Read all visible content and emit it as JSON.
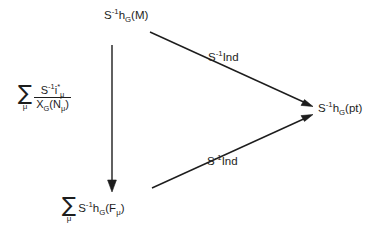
{
  "diagram": {
    "type": "commutative-triangle",
    "nodes": [
      {
        "id": "top",
        "name": "node-top",
        "tex": "S^{-1} h_G(M)",
        "base": "S",
        "exponent": "-1",
        "functor": "h",
        "functor_sub": "G",
        "argument": "(M)",
        "has_sum": false
      },
      {
        "id": "right",
        "name": "node-right",
        "tex": "S^{-1} h_G(pt)",
        "base": "S",
        "exponent": "-1",
        "functor": "h",
        "functor_sub": "G",
        "argument": "(pt)",
        "has_sum": false
      },
      {
        "id": "bottom",
        "name": "node-bottom",
        "tex": "\\sum_\\mu S^{-1} h_G(F_\\mu)",
        "sum_symbol": "∑",
        "sum_index": "μ",
        "base": "S",
        "exponent": "-1",
        "functor": "h",
        "functor_sub": "G",
        "argument_open": "(",
        "argument_sym": "F",
        "argument_sub": "μ",
        "argument_close": ")",
        "has_sum": true
      }
    ],
    "edges": [
      {
        "id": "top-to-right",
        "name": "arrow-top-to-right",
        "from": "top",
        "to": "right",
        "label": {
          "base": "S",
          "exponent": "-1",
          "operator": "Ind"
        }
      },
      {
        "id": "bottom-to-right",
        "name": "arrow-bottom-to-right",
        "from": "bottom",
        "to": "right",
        "label": {
          "base": "S",
          "exponent": "-1",
          "operator": "Ind"
        }
      },
      {
        "id": "top-to-bottom",
        "name": "arrow-top-to-bottom",
        "from": "top",
        "to": "bottom",
        "label": null
      }
    ],
    "side_expression": {
      "name": "side-expression",
      "tex": "\\sum_\\mu \\frac{S^{-1} i^*_\\mu}{X_G(N_\\mu)}",
      "sum_symbol": "∑",
      "sum_index": "μ",
      "numerator": {
        "base": "S",
        "exponent": "-1",
        "symbol": "i",
        "star": "*",
        "subscript": "μ"
      },
      "denominator": {
        "symbol": "X",
        "subscript": "G",
        "argument_open": "(",
        "argument_sym": "N",
        "argument_sub": "μ",
        "argument_close": ")"
      }
    },
    "style": {
      "stroke": "#1d1d1d",
      "background": "#ffffff"
    }
  }
}
